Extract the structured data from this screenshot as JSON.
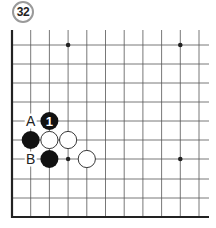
{
  "problem": {
    "number": "32"
  },
  "board": {
    "left_x": 12,
    "bottom_y": 217,
    "top_y": 30,
    "right_x": 209,
    "cols_x": [
      12,
      30.7,
      49.4,
      68.1,
      86.8,
      105.5,
      124.2,
      142.9,
      161.6,
      180.3,
      199
    ],
    "rows_y": [
      45,
      64,
      83,
      102,
      121,
      140,
      159,
      179,
      198,
      217
    ],
    "star_points": [
      {
        "col": 3,
        "row": 0
      },
      {
        "col": 9,
        "row": 0
      },
      {
        "col": 9,
        "row": 6
      }
    ],
    "stones": [
      {
        "color": "black",
        "col": 2,
        "row": 4,
        "label": "1"
      },
      {
        "color": "black",
        "col": 1,
        "row": 5,
        "label": ""
      },
      {
        "color": "white",
        "col": 2,
        "row": 5,
        "label": ""
      },
      {
        "color": "white",
        "col": 3,
        "row": 5,
        "label": ""
      },
      {
        "color": "black",
        "col": 2,
        "row": 6,
        "label": ""
      },
      {
        "color": "white",
        "col": 4,
        "row": 6,
        "label": ""
      }
    ],
    "small_marks": [
      {
        "col": 3,
        "row": 6
      }
    ],
    "letters": [
      {
        "text": "A",
        "col": 1,
        "row": 4
      },
      {
        "text": "B",
        "col": 1,
        "row": 6
      }
    ],
    "colors": {
      "line": "#555555",
      "edge": "#222222",
      "black_stone": "#111111",
      "white_stone": "#ffffff",
      "label_on_black": "#ffffff"
    }
  }
}
